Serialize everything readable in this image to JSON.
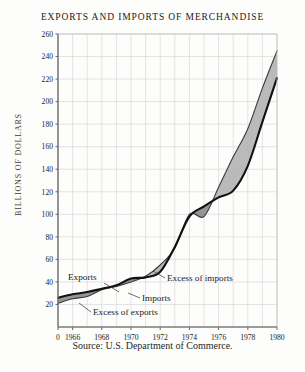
{
  "chart_data": {
    "type": "line",
    "title": "EXPORTS AND IMPORTS OF MERCHANDISE",
    "xlabel": "",
    "ylabel": "BILLIONS OF DOLLARS",
    "ylim": [
      0,
      260
    ],
    "xlim": [
      1965,
      1980
    ],
    "grid": true,
    "legend_position": "inline-annotations",
    "ytick_labels": [
      "0",
      "20",
      "40",
      "60",
      "80",
      "100",
      "120",
      "140",
      "160",
      "180",
      "200",
      "220",
      "240",
      "260"
    ],
    "ytick_values": [
      0,
      20,
      40,
      60,
      80,
      100,
      120,
      140,
      160,
      180,
      200,
      220,
      240,
      260
    ],
    "xtick_labels": [
      "0",
      "1966",
      "1968",
      "1970",
      "1972",
      "1974",
      "1976",
      "1978",
      "1980"
    ],
    "xtick_values": [
      1965,
      1966,
      1968,
      1970,
      1972,
      1974,
      1976,
      1978,
      1980
    ],
    "x": [
      1965,
      1966,
      1967,
      1968,
      1969,
      1970,
      1971,
      1972,
      1973,
      1974,
      1975,
      1976,
      1977,
      1978,
      1979,
      1980
    ],
    "series": [
      {
        "name": "Exports",
        "values": [
          26,
          29,
          31,
          34,
          37,
          43,
          44,
          49,
          71,
          98,
          107,
          115,
          121,
          143,
          182,
          221
        ]
      },
      {
        "name": "Imports",
        "values": [
          21,
          25,
          27,
          33,
          36,
          40,
          45,
          55,
          70,
          100,
          98,
          124,
          151,
          176,
          212,
          245
        ]
      }
    ],
    "annotations": [
      "Exports",
      "Imports",
      "Excess of imports",
      "Excess of exports"
    ],
    "source": "Source: U.S. Department of Commerce.",
    "colors": {
      "line": "#111111",
      "fill_excess": "#b6b6b6",
      "grid": "#d8d8d8",
      "axis": "#555555",
      "background": "#fdfdfc"
    }
  },
  "annotations": {
    "exports": "Exports",
    "imports": "Imports",
    "excess_of_imports": "Excess of imports",
    "excess_of_exports": "Excess of exports"
  },
  "axis": {
    "y_title": "BILLIONS OF DOLLARS",
    "y_ticks": [
      "260",
      "240",
      "220",
      "200",
      "180",
      "160",
      "140",
      "120",
      "100",
      "80",
      "60",
      "40",
      "20"
    ],
    "x_ticks": [
      "0",
      "1966",
      "1968",
      "1970",
      "1972",
      "1974",
      "1976",
      "1978",
      "1980"
    ]
  },
  "header": {
    "title": "EXPORTS AND IMPORTS OF MERCHANDISE"
  },
  "footer": {
    "source": "Source: U.S. Department of Commerce."
  }
}
